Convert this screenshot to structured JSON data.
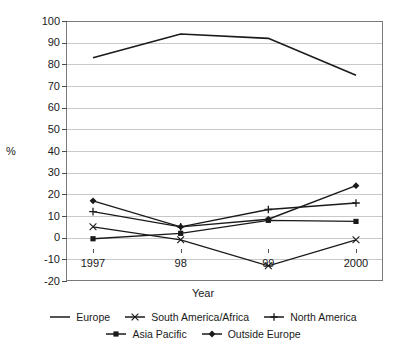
{
  "chart_data": {
    "type": "line",
    "title": "",
    "xlabel": "Year",
    "ylabel": "%",
    "categories": [
      "1997",
      "98",
      "99",
      "2000"
    ],
    "ylim": [
      -20,
      100
    ],
    "ytick_step": 10,
    "yticks": [
      100,
      90,
      80,
      70,
      60,
      50,
      40,
      30,
      20,
      10,
      0,
      -10,
      -20
    ],
    "grid": true,
    "legend_position": "bottom",
    "series": [
      {
        "name": "Europe",
        "marker": "none",
        "color": "#1a1a1a",
        "values": [
          83,
          94,
          92,
          75
        ]
      },
      {
        "name": "South America/Africa",
        "marker": "x",
        "color": "#1a1a1a",
        "values": [
          5,
          -1,
          -13,
          -1
        ]
      },
      {
        "name": "North America",
        "marker": "plus",
        "color": "#1a1a1a",
        "values": [
          12,
          5,
          13,
          16
        ]
      },
      {
        "name": "Asia Pacific",
        "marker": "square",
        "color": "#1a1a1a",
        "values": [
          -0.5,
          2,
          8,
          7.5
        ]
      },
      {
        "name": "Outside Europe",
        "marker": "diamond",
        "color": "#1a1a1a",
        "values": [
          17,
          5,
          8.5,
          24
        ]
      }
    ]
  },
  "axis": {
    "y_title": "%",
    "x_title": "Year",
    "y_labels": [
      "100",
      "90",
      "80",
      "70",
      "60",
      "50",
      "40",
      "30",
      "20",
      "10",
      "0",
      "-10",
      "-20"
    ],
    "x_labels": [
      "1997",
      "98",
      "99",
      "2000"
    ]
  },
  "legend": {
    "row1": [
      {
        "label": "Europe",
        "marker": "none"
      },
      {
        "label": "South America/Africa",
        "marker": "x"
      },
      {
        "label": "North America",
        "marker": "plus"
      }
    ],
    "row2": [
      {
        "label": "Asia Pacific",
        "marker": "square"
      },
      {
        "label": "Outside Europe",
        "marker": "diamond"
      }
    ]
  },
  "colors": {
    "ink": "#1a1a1a",
    "grid": "#c9c9c9",
    "frame": "#7a7a7a",
    "background": "#ffffff"
  }
}
